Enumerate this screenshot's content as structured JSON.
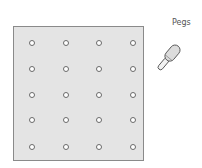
{
  "label": "Pegs",
  "board": {
    "rows": 5,
    "cols": 4,
    "hole_x": [
      31,
      65,
      98,
      132
    ],
    "hole_y": [
      42,
      68,
      94,
      119,
      146
    ]
  },
  "colors": {
    "board_fill": "#e4e4e4",
    "board_border": "#8a8a8a",
    "hole_border": "#6a6a6a"
  }
}
